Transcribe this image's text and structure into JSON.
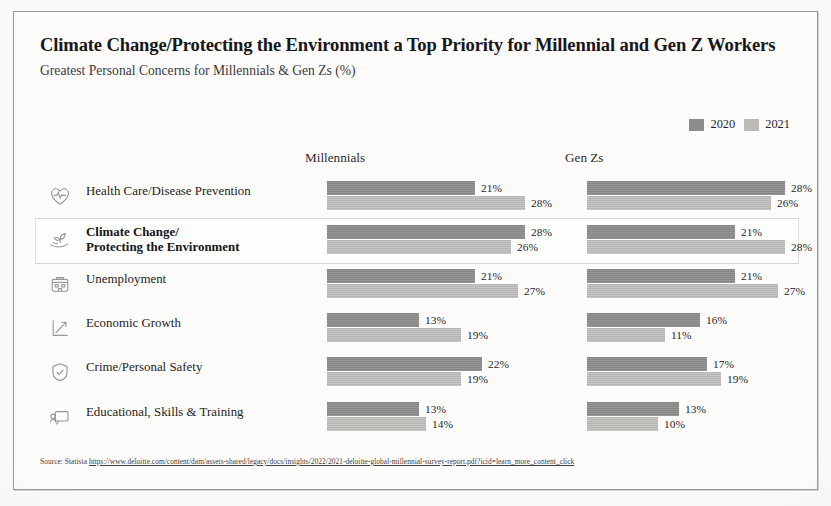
{
  "header": {
    "title": "Climate Change/Protecting the Environment a Top Priority for Millennial and Gen Z Workers",
    "subtitle": "Greatest Personal Concerns for Millennials & Gen Zs (%)"
  },
  "legend": {
    "items": [
      {
        "label": "2020",
        "color": "#8e8d8b"
      },
      {
        "label": "2021",
        "color": "#bcbbb8"
      }
    ]
  },
  "columns": {
    "millennials": "Millennials",
    "gen_zs": "Gen Zs"
  },
  "rows": [
    {
      "label_line1": "Health Care/Disease Prevention",
      "label_line2": "",
      "icon": "heart-pulse-icon",
      "highlighted": false,
      "millennials": {
        "y2020": "21%",
        "y2021": "28%"
      },
      "gen_zs": {
        "y2020": "28%",
        "y2021": "26%"
      }
    },
    {
      "label_line1": "Climate Change/",
      "label_line2": "Protecting the Environment",
      "icon": "hand-plant-icon",
      "highlighted": true,
      "millennials": {
        "y2020": "28%",
        "y2021": "26%"
      },
      "gen_zs": {
        "y2020": "21%",
        "y2021": "28%"
      }
    },
    {
      "label_line1": "Unemployment",
      "label_line2": "",
      "icon": "office-building-icon",
      "highlighted": false,
      "millennials": {
        "y2020": "21%",
        "y2021": "27%"
      },
      "gen_zs": {
        "y2020": "21%",
        "y2021": "27%"
      }
    },
    {
      "label_line1": "Economic Growth",
      "label_line2": "",
      "icon": "growth-chart-icon",
      "highlighted": false,
      "millennials": {
        "y2020": "13%",
        "y2021": "19%"
      },
      "gen_zs": {
        "y2020": "16%",
        "y2021": "11%"
      }
    },
    {
      "label_line1": "Crime/Personal Safety",
      "label_line2": "",
      "icon": "shield-check-icon",
      "highlighted": false,
      "millennials": {
        "y2020": "22%",
        "y2021": "19%"
      },
      "gen_zs": {
        "y2020": "17%",
        "y2021": "19%"
      }
    },
    {
      "label_line1": "Educational, Skills & Training",
      "label_line2": "",
      "icon": "presentation-board-icon",
      "highlighted": false,
      "millennials": {
        "y2020": "13%",
        "y2021": "14%"
      },
      "gen_zs": {
        "y2020": "13%",
        "y2021": "10%"
      }
    }
  ],
  "source": {
    "prefix": "Source: Statista ",
    "url": "https://www.deloitte.com/content/dam/assets-shared/legacy/docs/insights/2022/2021-deloitte-global-millennial-survey-report.pdf?icid=learn_more_content_click"
  },
  "chart_data": {
    "type": "bar",
    "title": "Climate Change/Protecting the Environment a Top Priority for Millennial and Gen Z Workers",
    "subtitle": "Greatest Personal Concerns for Millennials & Gen Zs (%)",
    "xlabel": "",
    "ylabel": "",
    "xlim": [
      0,
      30
    ],
    "grid": false,
    "legend_position": "top-right",
    "orientation": "horizontal",
    "panels": [
      {
        "name": "Millennials",
        "categories": [
          "Health Care/Disease Prevention",
          "Climate Change/Protecting the Environment",
          "Unemployment",
          "Economic Growth",
          "Crime/Personal Safety",
          "Educational, Skills & Training"
        ],
        "series": [
          {
            "name": "2020",
            "color": "#8e8d8b",
            "values": [
              21,
              28,
              21,
              13,
              22,
              13
            ]
          },
          {
            "name": "2021",
            "color": "#bcbbb8",
            "values": [
              28,
              26,
              27,
              19,
              19,
              14
            ]
          }
        ]
      },
      {
        "name": "Gen Zs",
        "categories": [
          "Health Care/Disease Prevention",
          "Climate Change/Protecting the Environment",
          "Unemployment",
          "Economic Growth",
          "Crime/Personal Safety",
          "Educational, Skills & Training"
        ],
        "series": [
          {
            "name": "2020",
            "color": "#8e8d8b",
            "values": [
              28,
              21,
              21,
              16,
              17,
              13
            ]
          },
          {
            "name": "2021",
            "color": "#bcbbb8",
            "values": [
              26,
              28,
              27,
              11,
              19,
              10
            ]
          }
        ]
      }
    ]
  }
}
